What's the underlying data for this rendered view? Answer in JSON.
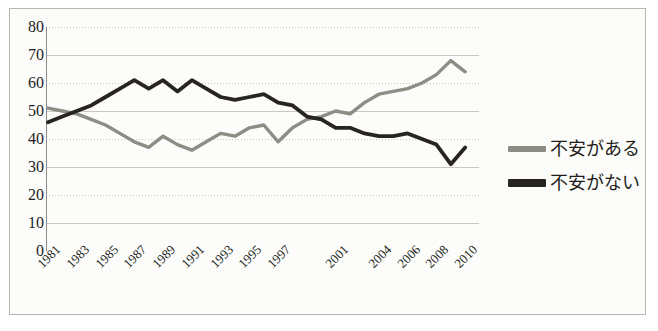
{
  "chart_data": {
    "type": "line",
    "title": "",
    "xlabel": "",
    "ylabel": "",
    "ylim": [
      0,
      80
    ],
    "ytick_step": 10,
    "yticks": [
      "80",
      "70",
      "60",
      "50",
      "40",
      "30",
      "20",
      "10",
      "0"
    ],
    "grid": true,
    "legend_position": "right",
    "x": [
      "1981",
      "1982",
      "1983",
      "1984",
      "1985",
      "1986",
      "1987",
      "1988",
      "1989",
      "1990",
      "1991",
      "1992",
      "1993",
      "1994",
      "1995",
      "1996",
      "1997",
      "1998",
      "1999",
      "2000",
      "2001",
      "2002",
      "2003",
      "2004",
      "2005",
      "2006",
      "2007",
      "2008",
      "2009",
      "2010"
    ],
    "xtick_labels": [
      "1981",
      "1983",
      "1985",
      "1987",
      "1989",
      "1991",
      "1993",
      "1995",
      "1997",
      "2001",
      "2004",
      "2006",
      "2008",
      "2010"
    ],
    "series": [
      {
        "name": "不安がある",
        "color": "#8d8d86",
        "values": [
          51,
          50,
          49,
          47,
          45,
          42,
          39,
          37,
          41,
          38,
          36,
          39,
          42,
          41,
          44,
          45,
          39,
          44,
          47,
          48,
          50,
          49,
          53,
          56,
          57,
          58,
          60,
          63,
          68,
          64
        ]
      },
      {
        "name": "不安がない",
        "color": "#282420",
        "values": [
          46,
          48,
          50,
          52,
          55,
          58,
          61,
          58,
          61,
          57,
          61,
          58,
          55,
          54,
          55,
          56,
          53,
          52,
          48,
          47,
          44,
          44,
          42,
          41,
          41,
          42,
          40,
          38,
          31,
          37
        ]
      }
    ],
    "legend": [
      {
        "label": "不安がある",
        "color": "#8d8d86",
        "style": "line-thin"
      },
      {
        "label": "不安がない",
        "color": "#282420",
        "style": "line-thick"
      }
    ]
  },
  "colors": {
    "background": "#fcfcfa",
    "frame": "#b8b5ad",
    "gridline": "#c9c7bf",
    "axis": "#8e8b84",
    "text": "#231f1c",
    "series_anxious": "#8d8d86",
    "series_not_anxious": "#282420"
  }
}
